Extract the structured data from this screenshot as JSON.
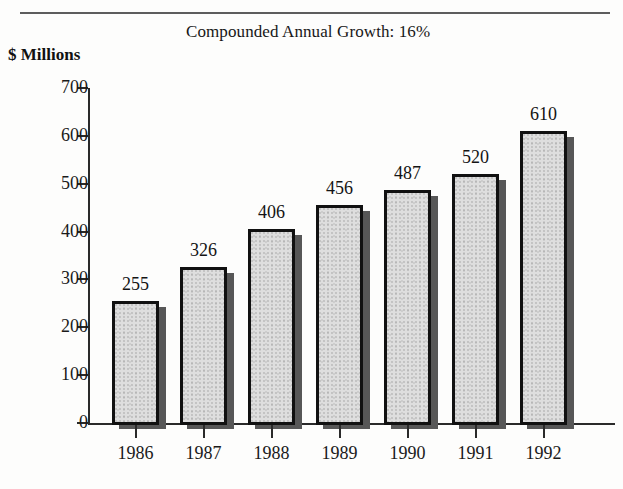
{
  "chart_data": {
    "type": "bar",
    "title": "Compounded Annual Growth: 16%",
    "ylabel": "$ Millions",
    "xlabel": "",
    "categories": [
      "1986",
      "1987",
      "1988",
      "1989",
      "1990",
      "1991",
      "1992"
    ],
    "values": [
      255,
      326,
      406,
      456,
      487,
      520,
      610
    ],
    "ylim": [
      0,
      700
    ],
    "ytick_labels": [
      "0",
      "100",
      "200",
      "300",
      "400",
      "500",
      "600",
      "700"
    ],
    "ytick_values": [
      0,
      100,
      200,
      300,
      400,
      500,
      600,
      700
    ],
    "grid": false,
    "legend": null,
    "data_labels_shown": true,
    "annotations": [],
    "colors": {
      "bar_fill": "#dedede",
      "bar_border": "#111111",
      "bar_shadow": "#575757",
      "axis": "#2a2a2a",
      "text": "#1a1a1a",
      "rule": "#5d5d5d"
    }
  }
}
